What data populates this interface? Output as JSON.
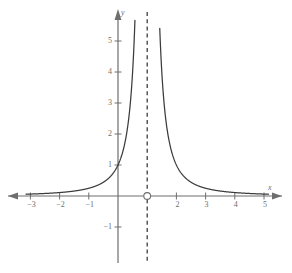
{
  "chart_data": {
    "type": "line",
    "title": "",
    "subtitle": "",
    "xlabel": "x",
    "ylabel": "y",
    "xlim": [
      -3.15,
      5.15
    ],
    "ylim": [
      -1.6,
      5.9
    ],
    "grid": false,
    "legend": null,
    "x_ticks": [
      {
        "value": -3,
        "label": "−3"
      },
      {
        "value": -2,
        "label": "−2"
      },
      {
        "value": -1,
        "label": "−1"
      },
      {
        "value": 2,
        "label": "2"
      },
      {
        "value": 3,
        "label": "3"
      },
      {
        "value": 4,
        "label": "4"
      },
      {
        "value": 5,
        "label": "5"
      }
    ],
    "y_ticks": [
      {
        "value": -1,
        "label": "−1"
      },
      {
        "value": 1,
        "label": "1"
      },
      {
        "value": 2,
        "label": "2"
      },
      {
        "value": 3,
        "label": "3"
      },
      {
        "value": 4,
        "label": "4"
      },
      {
        "value": 5,
        "label": "5"
      }
    ],
    "series": [
      {
        "name": "y = 1/(x-1)^2",
        "kind": "curve",
        "color": "#3c3c3c",
        "expression": "1/(x-1)^2",
        "branches": [
          {
            "name": "left-branch",
            "x_from": -3.15,
            "x_to": 0.58
          },
          {
            "name": "right-branch",
            "x_from": 1.43,
            "x_to": 5.15
          }
        ],
        "notable_points": [
          {
            "x": 0,
            "y": 1,
            "label": "y-intercept"
          },
          {
            "x": -1,
            "y": 0.25,
            "label": ""
          },
          {
            "x": 2,
            "y": 1,
            "label": ""
          },
          {
            "x": 3,
            "y": 0.25,
            "label": ""
          }
        ]
      }
    ],
    "asymptotes": [
      {
        "name": "vertical-asymptote",
        "type": "vertical",
        "value": 1,
        "style": "dashed",
        "color": "#3c3c3c"
      },
      {
        "name": "horizontal-asymptote",
        "type": "horizontal",
        "value": 0,
        "style": "implied",
        "color": "#6e6e6e"
      }
    ],
    "markers": [
      {
        "name": "open-circle-marker",
        "x": 1,
        "y": 0,
        "style": "open-circle",
        "color": "#6e6e6e"
      }
    ],
    "axis_color": "#6e6e6e",
    "curve_color": "#3c3c3c",
    "background_color": "#ffffff"
  },
  "geometry": {
    "origin_x": 118,
    "origin_y": 196,
    "unit_x": 29.2,
    "unit_y": 31.0
  }
}
